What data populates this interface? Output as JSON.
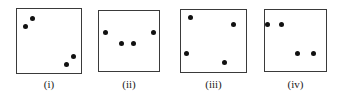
{
  "figure": {
    "background_color": "#ffffff",
    "border_color": "#3a3a3a",
    "dot_color": "#111111",
    "label_color": "#1a1a1a",
    "panels": [
      {
        "label": "(i)",
        "box": {
          "x": 16,
          "y": 8,
          "width": 66,
          "height": 66
        },
        "label_y": 78,
        "dot_count": 4,
        "dots": [
          {
            "x": 32,
            "y": 18
          },
          {
            "x": 25,
            "y": 26
          },
          {
            "x": 73,
            "y": 56
          },
          {
            "x": 66,
            "y": 64
          }
        ]
      },
      {
        "label": "(ii)",
        "box": {
          "x": 98,
          "y": 10,
          "width": 62,
          "height": 62
        },
        "label_y": 78,
        "dot_count": 4,
        "dots": [
          {
            "x": 105,
            "y": 32
          },
          {
            "x": 153,
            "y": 32
          },
          {
            "x": 121,
            "y": 43
          },
          {
            "x": 133,
            "y": 43
          }
        ]
      },
      {
        "label": "(iii)",
        "box": {
          "x": 180,
          "y": 9,
          "width": 67,
          "height": 64
        },
        "label_y": 78,
        "dot_count": 4,
        "dots": [
          {
            "x": 190,
            "y": 17
          },
          {
            "x": 233,
            "y": 24
          },
          {
            "x": 186,
            "y": 53
          },
          {
            "x": 224,
            "y": 62
          }
        ]
      },
      {
        "label": "(iv)",
        "box": {
          "x": 264,
          "y": 9,
          "width": 63,
          "height": 63
        },
        "label_y": 78,
        "dot_count": 4,
        "dots": [
          {
            "x": 267,
            "y": 24
          },
          {
            "x": 281,
            "y": 24
          },
          {
            "x": 297,
            "y": 53
          },
          {
            "x": 313,
            "y": 53
          }
        ]
      }
    ]
  }
}
